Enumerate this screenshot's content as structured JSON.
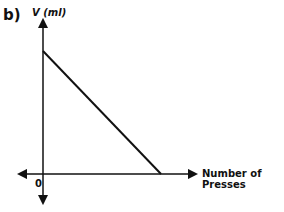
{
  "panel_label": "b)",
  "chart_data": {
    "type": "line",
    "title": "",
    "xlabel": "Number of Presses",
    "ylabel": "V (ml)",
    "origin_label": "0",
    "x_ticks": [],
    "y_ticks": [],
    "grid": false,
    "legend": null,
    "axis_numeric_values_shown": false,
    "series": [
      {
        "name": "V",
        "description": "Straight line decreasing linearly from a positive y-intercept down to the x-axis. No numeric scale is shown, so endpoints are given in normalized coordinates (fractions of the drawn axis extent), not data values.",
        "points_normalized": [
          {
            "x": 0.0,
            "y": 1.0
          },
          {
            "x": 1.0,
            "y": 0.0
          }
        ]
      }
    ],
    "axes": {
      "x_axis": "horizontal with arrows at both ends",
      "y_axis": "vertical with arrows at both ends"
    }
  },
  "colors": {
    "ink": "#111111",
    "background": "#ffffff"
  }
}
